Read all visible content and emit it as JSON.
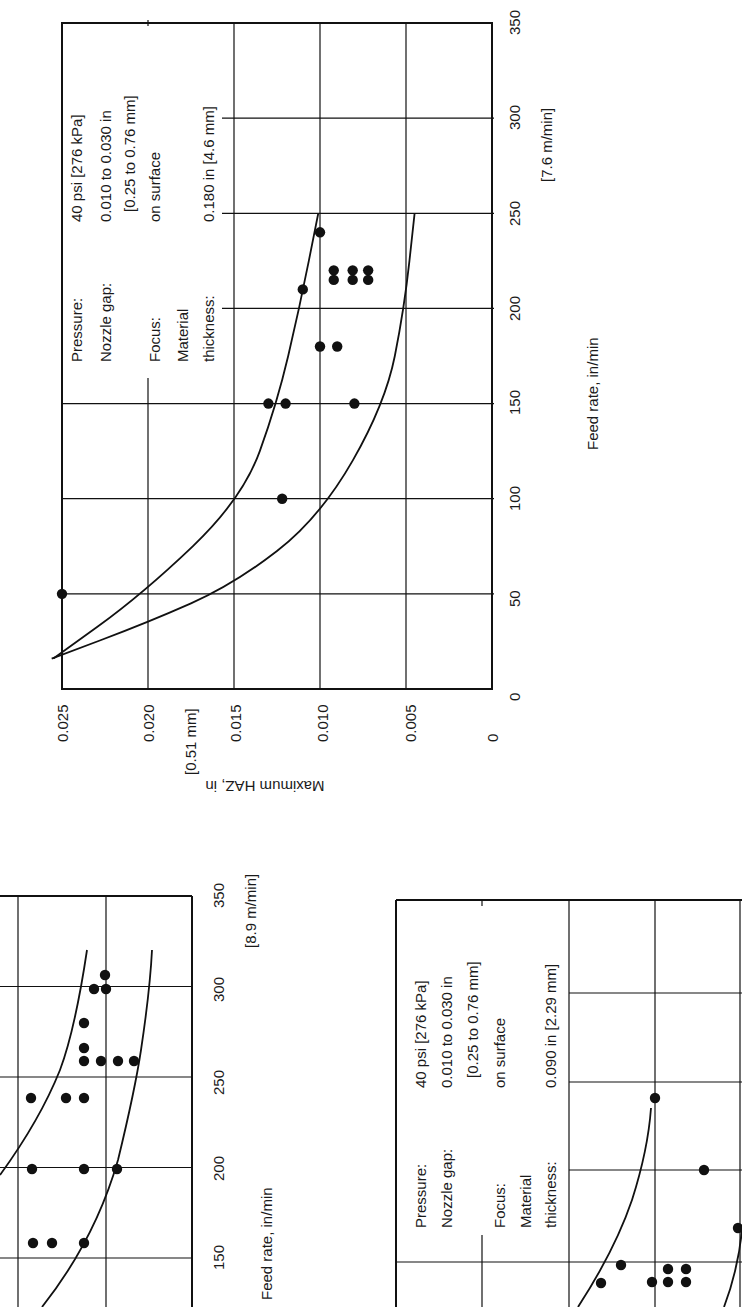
{
  "page": {
    "orientation_note": "Charts printed rotated 90° counter-clockwise on page",
    "background": "#ffffff",
    "ink": "#111111"
  },
  "chart_data": [
    {
      "id": "chart-top",
      "type": "scatter",
      "title": "",
      "xlabel": "Feed rate, in/min",
      "xlabel_metric_note": "[7.6 m/min]",
      "ylabel": "Maximum HAZ, in",
      "ylabel_metric_note": "[0.51 mm]",
      "xlim": [
        0,
        350
      ],
      "ylim": [
        0,
        0.025
      ],
      "x_ticks": [
        0,
        50,
        100,
        150,
        200,
        250,
        300,
        350
      ],
      "y_ticks": [
        "0",
        "0.005",
        "0.010",
        "0.015",
        "0.020",
        "0.025"
      ],
      "grid": true,
      "annotation": {
        "rows": [
          {
            "label": "Pressure:",
            "value": "40 psi [276 kPa]"
          },
          {
            "label": "Nozzle gap:",
            "value": "0.010 to 0.030 in"
          },
          {
            "label": "",
            "value": "[0.25 to 0.76 mm]"
          },
          {
            "label": "Focus:",
            "value": "on surface"
          },
          {
            "label": "Material",
            "value": ""
          },
          {
            "label": "thickness:",
            "value": "0.180 in [4.6 mm]"
          }
        ]
      },
      "points": [
        {
          "x": 50,
          "y": 0.025
        },
        {
          "x": 100,
          "y": 0.0122
        },
        {
          "x": 150,
          "y": 0.013
        },
        {
          "x": 150,
          "y": 0.012
        },
        {
          "x": 150,
          "y": 0.008
        },
        {
          "x": 180,
          "y": 0.01
        },
        {
          "x": 180,
          "y": 0.009
        },
        {
          "x": 210,
          "y": 0.011
        },
        {
          "x": 215,
          "y": 0.0092
        },
        {
          "x": 215,
          "y": 0.0081
        },
        {
          "x": 215,
          "y": 0.0072
        },
        {
          "x": 220,
          "y": 0.0092
        },
        {
          "x": 220,
          "y": 0.0081
        },
        {
          "x": 220,
          "y": 0.0072
        },
        {
          "x": 240,
          "y": 0.01
        }
      ],
      "series": [
        {
          "name": "upper bound",
          "values": [
            [
              16,
              0.0255
            ],
            [
              50,
              0.0203
            ],
            [
              100,
              0.0145
            ],
            [
              150,
              0.0125
            ],
            [
              200,
              0.0112
            ],
            [
              250,
              0.0101
            ]
          ]
        },
        {
          "name": "lower bound",
          "values": [
            [
              16,
              0.0256
            ],
            [
              35,
              0.02
            ],
            [
              55,
              0.015
            ],
            [
              90,
              0.01
            ],
            [
              150,
              0.0062
            ],
            [
              200,
              0.0051
            ],
            [
              250,
              0.0045
            ]
          ]
        }
      ]
    },
    {
      "id": "chart-bottom-left",
      "type": "scatter",
      "title": "",
      "xlabel": "Feed rate, in/min",
      "xlabel_metric_note": "[8.9 m/min]",
      "ylabel": "Maximum HAZ, in",
      "xlim": [
        150,
        350
      ],
      "x_ticks": [
        150,
        200,
        250,
        300,
        350
      ],
      "grid": true,
      "visible_portion_note": "partially cropped at page edge",
      "points": [
        {
          "x": 160,
          "y": 0.0086
        },
        {
          "x": 160,
          "y": 0.0076
        },
        {
          "x": 160,
          "y": 0.0058
        },
        {
          "x": 200,
          "y": 0.0087
        },
        {
          "x": 200,
          "y": 0.0058
        },
        {
          "x": 200,
          "y": 0.0039
        },
        {
          "x": 240,
          "y": 0.0088
        },
        {
          "x": 240,
          "y": 0.0068
        },
        {
          "x": 240,
          "y": 0.0058
        },
        {
          "x": 260,
          "y": 0.0058
        },
        {
          "x": 260,
          "y": 0.0049
        },
        {
          "x": 260,
          "y": 0.0039
        },
        {
          "x": 260,
          "y": 0.003
        },
        {
          "x": 267,
          "y": 0.0058
        },
        {
          "x": 280,
          "y": 0.0058
        },
        {
          "x": 300,
          "y": 0.0052
        },
        {
          "x": 300,
          "y": 0.0045
        },
        {
          "x": 305,
          "y": 0.0045
        }
      ],
      "series": [
        {
          "name": "upper bound",
          "values": [
            [
              150,
              0.011
            ],
            [
              200,
              0.0085
            ],
            [
              250,
              0.0072
            ],
            [
              300,
              0.0066
            ],
            [
              320,
              0.0063
            ]
          ]
        },
        {
          "name": "lower bound",
          "values": [
            [
              120,
              0.008
            ],
            [
              150,
              0.006
            ],
            [
              200,
              0.0042
            ],
            [
              250,
              0.0034
            ],
            [
              300,
              0.003
            ],
            [
              320,
              0.0029
            ]
          ]
        }
      ]
    },
    {
      "id": "chart-bottom-right",
      "type": "scatter",
      "title": "",
      "visible_portion_note": "partially cropped at page edge",
      "annotation": {
        "rows": [
          {
            "label": "Pressure:",
            "value": "40 psi [276 kPa]"
          },
          {
            "label": "Nozzle gap:",
            "value": "0.010 to 0.030 in"
          },
          {
            "label": "",
            "value": "[0.25 to 0.76 mm]"
          },
          {
            "label": "Focus:",
            "value": "on surface"
          },
          {
            "label": "Material",
            "value": ""
          },
          {
            "label": "thickness:",
            "value": "0.090 in [2.29 mm]"
          }
        ]
      },
      "points_image_px": [
        [
          655,
          1098
        ],
        [
          704,
          1170
        ],
        [
          738,
          1228
        ],
        [
          621,
          1265
        ],
        [
          601,
          1283
        ],
        [
          668,
          1269
        ],
        [
          686,
          1269
        ],
        [
          668,
          1282
        ],
        [
          686,
          1282
        ],
        [
          652,
          1282
        ]
      ],
      "series": [
        {
          "name": "upper bound"
        },
        {
          "name": "lower bound"
        }
      ]
    }
  ],
  "labels": {
    "top": {
      "x_axis_title": "Feed rate, in/min",
      "x_metric": "[7.6 m/min]",
      "y_axis_title": "Maximum HAZ, in",
      "y_metric": "[0.51 mm]",
      "x_tick_labels": [
        "0",
        "50",
        "100",
        "150",
        "200",
        "250",
        "300",
        "350"
      ],
      "y_tick_labels": [
        "0.025",
        "0.020",
        "0.015",
        "0.010",
        "0.005",
        "0"
      ]
    },
    "bottom_left": {
      "x_axis_title": "Feed rate, in/min",
      "x_metric": "[8.9 m/min]",
      "x_tick_labels": [
        "150",
        "200",
        "250",
        "300",
        "350"
      ]
    }
  }
}
